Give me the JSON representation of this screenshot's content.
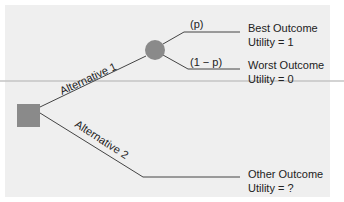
{
  "diagram": {
    "type": "decision-tree",
    "decision_node": {
      "shape": "square",
      "color": "#8a8a8a"
    },
    "chance_node": {
      "shape": "circle",
      "color": "#8a8a8a"
    },
    "branches": [
      {
        "label": "Alternative 1"
      },
      {
        "label": "Alternative 2"
      }
    ],
    "chance_branches": [
      {
        "probability": "(p)"
      },
      {
        "probability": "(1 − p)"
      }
    ],
    "outcomes": [
      {
        "name": "Best Outcome",
        "utility": "Utility = 1"
      },
      {
        "name": "Worst Outcome",
        "utility": "Utility = 0"
      },
      {
        "name": "Other Outcome",
        "utility": "Utility = ?"
      }
    ]
  }
}
